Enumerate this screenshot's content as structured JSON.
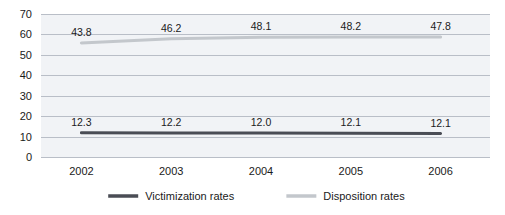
{
  "chart_data": {
    "type": "line",
    "title": "",
    "subtitle": "",
    "xlabel": "",
    "ylabel": "",
    "categories": [
      "2002",
      "2003",
      "2004",
      "2005",
      "2006"
    ],
    "x_tick_labels": [
      "2002",
      "2003",
      "2004",
      "2005",
      "2006"
    ],
    "y_tick_labels": [
      "70",
      "60",
      "50",
      "40",
      "30",
      "20",
      "10",
      "0"
    ],
    "y_ticks": [
      70,
      60,
      50,
      40,
      30,
      20,
      10,
      0
    ],
    "ylim": [
      0,
      70
    ],
    "grid": true,
    "legend_position": "bottom-center",
    "series": [
      {
        "name": "Victimization rates",
        "color": "#4a4d55",
        "values": [
          12.3,
          12.2,
          12.0,
          12.1,
          12.1
        ],
        "plotted_values": [
          11.9,
          11.8,
          11.7,
          11.6,
          11.5
        ],
        "labels": [
          "12.3",
          "12.2",
          "12.0",
          "12.1",
          "12.1"
        ]
      },
      {
        "name": "Disposition rates",
        "color": "#c3c7cc",
        "values": [
          43.8,
          46.2,
          48.1,
          48.2,
          47.8
        ],
        "plotted_values": [
          55.8,
          57.9,
          58.6,
          58.8,
          58.8
        ],
        "labels": [
          "43.8",
          "46.2",
          "48.1",
          "48.2",
          "47.8"
        ]
      }
    ],
    "legend": [
      {
        "label": "Victimization rates",
        "color": "#4a4d55"
      },
      {
        "label": "Disposition rates",
        "color": "#c3c7cc"
      }
    ],
    "colors": {
      "plot_background": "#f1f3f6",
      "gridline": "#b9bec7",
      "text": "#1a1a1a",
      "page_background": "#ffffff"
    }
  }
}
